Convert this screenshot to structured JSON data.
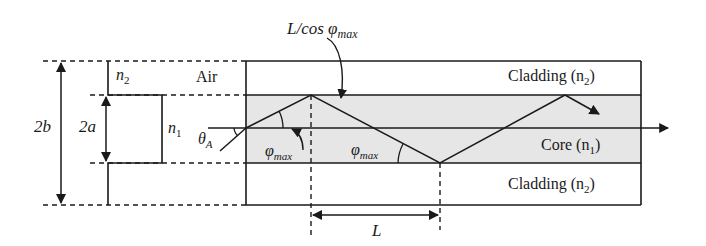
{
  "diagram": {
    "labels": {
      "path_length": "L/cos φ",
      "path_length_sub": "max",
      "air": "Air",
      "cladding_top": "Cladding (n",
      "cladding_top_sub": "2",
      "cladding_bottom": "Cladding (n",
      "cladding_bottom_sub": "2",
      "core": "Core (n",
      "core_sub": "1",
      "close_paren": ")",
      "n2": "n",
      "n2_sub": "2",
      "n1": "n",
      "n1_sub": "1",
      "two_b": "2b",
      "two_a": "2a",
      "theta": "θ",
      "theta_sub": "A",
      "phi1": "φ",
      "phi1_sub": "max",
      "phi2": "φ",
      "phi2_sub": "max",
      "L": "L"
    },
    "colors": {
      "line": "#1a1a1a",
      "core_fill": "#e6e6e6",
      "background": "#ffffff"
    }
  }
}
